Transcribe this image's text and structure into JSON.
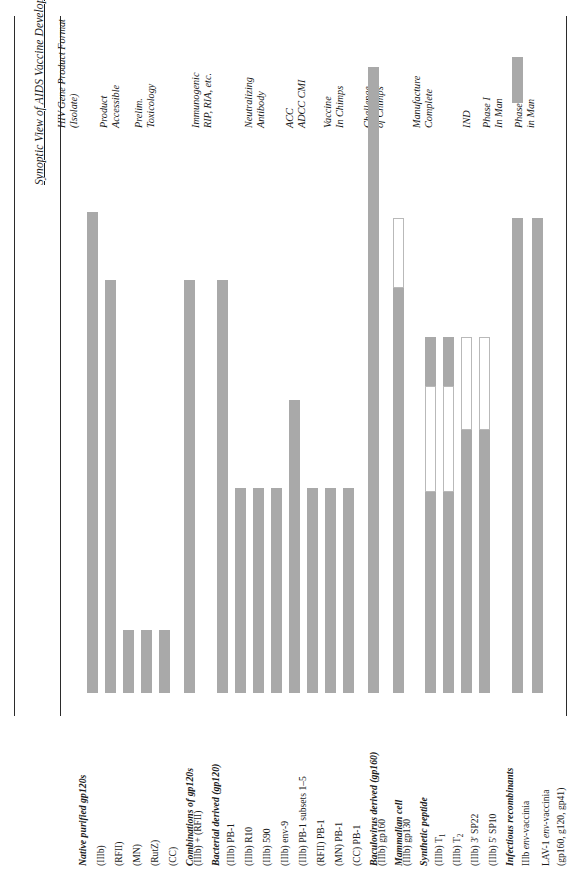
{
  "title": "Synoptic View of AIDS Vaccine Development",
  "columns": [
    {
      "id": "format",
      "line1": "HIV Gene Product Format",
      "line2": "(Isolate)"
    },
    {
      "id": "product",
      "line1": "Product",
      "line2": "Accessible"
    },
    {
      "id": "tox",
      "line1": "Prelim.",
      "line2": "Toxicology"
    },
    {
      "id": "immunogenic",
      "line1": "Immunogenic",
      "line2": "RIP, RIA, etc."
    },
    {
      "id": "neutralizing",
      "line1": "Neutralizing",
      "line2": "Antibody"
    },
    {
      "id": "adcc",
      "line1": "ACC",
      "line2": "ADCC   CMI"
    },
    {
      "id": "chimps",
      "line1": "Vaccine",
      "line2": "In Chimps"
    },
    {
      "id": "challenge",
      "line1": "Challenge",
      "line2": "of Chimps"
    },
    {
      "id": "manufacture",
      "line1": "Manufacture",
      "line2": "Complete"
    },
    {
      "id": "ind",
      "line1": "",
      "line2": "IND"
    },
    {
      "id": "phase1",
      "line1": "Phase I",
      "line2": "In Man"
    },
    {
      "id": "phase2",
      "line1": "Phase II",
      "line2": "in Man"
    }
  ],
  "rows": [
    {
      "type": "group",
      "label": "Native purified gp120s"
    },
    {
      "type": "item",
      "label": "(IIIb)"
    },
    {
      "type": "item",
      "label": "(RFII)"
    },
    {
      "type": "item",
      "label": "(MN)"
    },
    {
      "type": "item",
      "label": "(RutZ)"
    },
    {
      "type": "item",
      "label": "(CC)"
    },
    {
      "type": "group",
      "label": "Combinations of gp120s"
    },
    {
      "type": "item",
      "label": "(IIIb) + (RFII)"
    },
    {
      "type": "group",
      "label": "Bacterial derived (gp120)"
    },
    {
      "type": "item",
      "label": "(IIIb) PB-1"
    },
    {
      "type": "item",
      "label": "(IIIb) R10"
    },
    {
      "type": "item",
      "label": "(IIIb) 590"
    },
    {
      "type": "item",
      "label": "(IIIb) env-9"
    },
    {
      "type": "item",
      "label": "(IIIb) PB-1 subsets 1–5"
    },
    {
      "type": "item",
      "label": "(RFII) PB-1"
    },
    {
      "type": "item",
      "label": "(MN) PB-1"
    },
    {
      "type": "item",
      "label": "(CC) PB-1"
    },
    {
      "type": "group",
      "label": "Baculovirus derived (gp160)"
    },
    {
      "type": "item",
      "label": "(IIIb) gp160"
    },
    {
      "type": "group",
      "label": "Mammalian cell"
    },
    {
      "type": "item",
      "label": "(IIIb) gp130"
    },
    {
      "type": "group",
      "label": "Synthetic peptide"
    },
    {
      "type": "item",
      "label": "(IIIb) T1",
      "sub": "1",
      "base": "(IIIb) T"
    },
    {
      "type": "item",
      "label": "(IIIb) T2",
      "sub": "2",
      "base": "(IIIb) T"
    },
    {
      "type": "item",
      "label": "(IIIb) 3' SP22"
    },
    {
      "type": "item",
      "label": "(IIIb) 5' SP10"
    },
    {
      "type": "group",
      "label": "Infectious recombinants"
    },
    {
      "type": "item",
      "label": "IIIb env-vaccinia",
      "italic": "env"
    },
    {
      "type": "item",
      "label": "LAV-1 env-vaccinia",
      "italic": "env"
    },
    {
      "type": "item",
      "label": "(gp160, g120, gp41)"
    }
  ],
  "colors": {
    "bar_fill": "#a9a9a9",
    "bar_open_border": "#b9b9b9",
    "rule": "#2b2b2b",
    "text": "#1a1a1a"
  },
  "chart_data": {
    "type": "bar",
    "title": "Synoptic View of AIDS Vaccine Development",
    "orientation": "vertical-bars-over-rotated-table",
    "stage_axis": [
      "Product Accessible",
      "Prelim. Toxicology",
      "Immunogenic RIP, RIA, etc.",
      "Neutralizing Antibody",
      "ADCC / CMI",
      "Vaccine In Chimps",
      "Challenge of Chimps",
      "Manufacture Complete",
      "IND",
      "Phase I In Man",
      "Phase II in Man"
    ],
    "legend": [
      {
        "swatch": "filled",
        "meaning": "completed / achieved"
      },
      {
        "swatch": "open",
        "meaning": "in progress / not achieved"
      }
    ],
    "bars": [
      {
        "label": "(IIIb)",
        "x": 92,
        "segments": [
          {
            "style": "fill",
            "top": 212,
            "bottom": 693
          }
        ]
      },
      {
        "label": "(RFII)",
        "x": 110,
        "segments": [
          {
            "style": "fill",
            "top": 280,
            "bottom": 693
          }
        ]
      },
      {
        "label": "(MN)",
        "x": 128,
        "segments": [
          {
            "style": "fill",
            "top": 630,
            "bottom": 693
          }
        ]
      },
      {
        "label": "(RutZ)",
        "x": 146,
        "segments": [
          {
            "style": "fill",
            "top": 630,
            "bottom": 693
          }
        ]
      },
      {
        "label": "(CC)",
        "x": 164,
        "segments": [
          {
            "style": "fill",
            "top": 630,
            "bottom": 693
          }
        ]
      },
      {
        "label": "(IIIb) + (RFII)",
        "x": 189,
        "segments": [
          {
            "style": "fill",
            "top": 280,
            "bottom": 693
          }
        ]
      },
      {
        "label": "(IIIb) PB-1",
        "x": 222,
        "segments": [
          {
            "style": "fill",
            "top": 280,
            "bottom": 693
          }
        ]
      },
      {
        "label": "(IIIb) R10",
        "x": 240,
        "segments": [
          {
            "style": "fill",
            "top": 488,
            "bottom": 693
          }
        ]
      },
      {
        "label": "(IIIb) 590",
        "x": 258,
        "segments": [
          {
            "style": "fill",
            "top": 488,
            "bottom": 693
          }
        ]
      },
      {
        "label": "(IIIb) env-9",
        "x": 276,
        "segments": [
          {
            "style": "fill",
            "top": 488,
            "bottom": 693
          }
        ]
      },
      {
        "label": "(IIIb) PB-1 subsets 1–5",
        "x": 294,
        "segments": [
          {
            "style": "fill",
            "top": 400,
            "bottom": 693
          }
        ]
      },
      {
        "label": "(RFII) PB-1",
        "x": 312,
        "segments": [
          {
            "style": "fill",
            "top": 488,
            "bottom": 693
          }
        ]
      },
      {
        "label": "(MN) PB-1",
        "x": 330,
        "segments": [
          {
            "style": "fill",
            "top": 488,
            "bottom": 693
          }
        ]
      },
      {
        "label": "(CC) PB-1",
        "x": 348,
        "segments": [
          {
            "style": "fill",
            "top": 488,
            "bottom": 693
          }
        ]
      },
      {
        "label": "(IIIb) gp160",
        "x": 373,
        "segments": [
          {
            "style": "fill",
            "top": 67,
            "bottom": 693
          }
        ]
      },
      {
        "label": "(IIIb) gp130",
        "x": 398,
        "segments": [
          {
            "style": "open",
            "top": 218,
            "bottom": 288
          },
          {
            "style": "fill",
            "top": 288,
            "bottom": 693
          }
        ]
      },
      {
        "label": "(IIIb) T1",
        "x": 430,
        "segments": [
          {
            "style": "fill",
            "top": 337,
            "bottom": 386
          },
          {
            "style": "open",
            "top": 386,
            "bottom": 492
          },
          {
            "style": "fill",
            "top": 492,
            "bottom": 693
          }
        ]
      },
      {
        "label": "(IIIb) T2",
        "x": 448,
        "segments": [
          {
            "style": "fill",
            "top": 337,
            "bottom": 386
          },
          {
            "style": "open",
            "top": 386,
            "bottom": 492
          },
          {
            "style": "fill",
            "top": 492,
            "bottom": 693
          }
        ]
      },
      {
        "label": "(IIIb) 3' SP22",
        "x": 466,
        "segments": [
          {
            "style": "open",
            "top": 337,
            "bottom": 430
          },
          {
            "style": "fill",
            "top": 430,
            "bottom": 693
          }
        ]
      },
      {
        "label": "(IIIb) 5' SP10",
        "x": 484,
        "segments": [
          {
            "style": "open",
            "top": 337,
            "bottom": 430
          },
          {
            "style": "fill",
            "top": 430,
            "bottom": 693
          }
        ]
      },
      {
        "label": "IIIb env-vaccinia",
        "x": 517,
        "segments": [
          {
            "style": "fill",
            "top": 57,
            "bottom": 103
          },
          {
            "style": "fill",
            "top": 218,
            "bottom": 693
          }
        ]
      },
      {
        "label": "LAV-1 env-vaccinia",
        "x": 537,
        "segments": [
          {
            "style": "fill",
            "top": 218,
            "bottom": 693
          }
        ]
      }
    ]
  }
}
